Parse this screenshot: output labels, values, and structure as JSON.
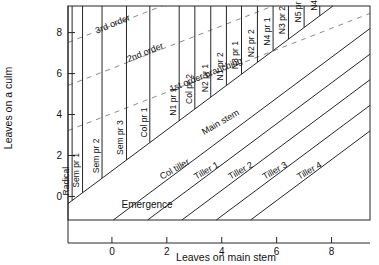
{
  "chart_data": {
    "type": "line",
    "title": "",
    "xlabel": "Leaves on main stem",
    "ylabel": "Leaves on a culm",
    "xlim": [
      -1.6,
      9.4
    ],
    "ylim": [
      -1.15,
      9.3
    ],
    "xticks": [
      0,
      2,
      4,
      6,
      8
    ],
    "yticks": [
      0,
      2,
      4,
      6,
      8
    ],
    "xticklabels": [
      "0",
      "2",
      "4",
      "6",
      "8"
    ],
    "yticklabels": [
      "0",
      "2",
      "4",
      "6",
      "8"
    ],
    "grid": false,
    "legend": "none",
    "annotations": [
      {
        "text": "Emergence",
        "x": 0.35,
        "y": -0.55
      },
      {
        "text": "Main stem",
        "x": 3.35,
        "y": 3.0
      },
      {
        "text": "1st order branching",
        "x": 2.15,
        "y": 5.1
      },
      {
        "text": "2nd order",
        "x": 0.6,
        "y": 6.55
      },
      {
        "text": "3rd order",
        "x": -0.55,
        "y": 7.95
      }
    ],
    "series": [
      {
        "name": "Main stem",
        "type": "solid-diagonal",
        "slope": 1,
        "x_intercept": -1.25,
        "label": "Main stem"
      },
      {
        "name": "Col tiller",
        "type": "solid-diagonal",
        "slope": 1,
        "x_intercept": 1.2,
        "label": "Col tiller"
      },
      {
        "name": "Tiller 1",
        "type": "solid-diagonal",
        "slope": 1,
        "x_intercept": 2.45,
        "label": "Tiller 1"
      },
      {
        "name": "Tiller 2",
        "type": "solid-diagonal",
        "slope": 1,
        "x_intercept": 3.7,
        "label": "Tiller 2"
      },
      {
        "name": "Tiller 3",
        "type": "solid-diagonal",
        "slope": 1,
        "x_intercept": 4.95,
        "label": "Tiller 3"
      },
      {
        "name": "Tiller 4",
        "type": "solid-diagonal",
        "slope": 1,
        "x_intercept": 6.2,
        "label": "Tiller 4"
      }
    ],
    "dashed_series": [
      {
        "name": "1st order branching",
        "slope": 0.52,
        "y_at_x0": 4.05,
        "label": "1st order branching"
      },
      {
        "name": "2nd order",
        "slope": 0.52,
        "y_at_x0": 6.25,
        "label": "2nd order"
      },
      {
        "name": "3rd order",
        "slope": 0.52,
        "y_at_x0": 8.35,
        "label": "3rd order"
      }
    ],
    "vertical_lines": [
      {
        "label": "Radical",
        "x": -1.45
      },
      {
        "label": "Sem pr 1",
        "x": -1.07
      },
      {
        "label": "Sem pr 2",
        "x": -0.36
      },
      {
        "label": "Sem pr 3",
        "x": 0.53
      },
      {
        "label": "Col pr 1",
        "x": 1.38
      },
      {
        "label": "N1 pr 1",
        "x": 2.45
      },
      {
        "label": "Col pr 2",
        "x": 3.02
      },
      {
        "label": "N2 pr 1",
        "x": 3.6
      },
      {
        "label": "N1 pr 2",
        "x": 4.17
      },
      {
        "label": "N3 pr 1",
        "x": 4.72
      },
      {
        "label": "N2 pr 2",
        "x": 5.3
      },
      {
        "label": "N4 pr 1",
        "x": 5.87
      },
      {
        "label": "N3 pr 2",
        "x": 6.43
      },
      {
        "label": "N5 pr 1",
        "x": 7.0
      },
      {
        "label": "N4 pr 2",
        "x": 7.57
      }
    ]
  },
  "colors": {
    "ink": "#1a1a1a",
    "line": "#262626",
    "dashed": "#8a8a8a",
    "background": "#ffffff"
  }
}
